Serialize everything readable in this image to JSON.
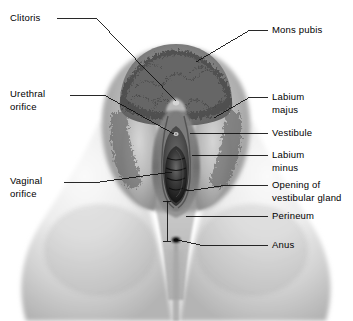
{
  "figure": {
    "type": "labeled-anatomical-illustration",
    "style": "grayscale halftone illustration",
    "background_color": "#ffffff",
    "leader_line_color": "#1a1a1a",
    "text_color": "#000000",
    "width": 353,
    "height": 321
  },
  "labels": {
    "clitoris": "Clitoris",
    "urethral_orifice": "Urethral\norifice",
    "vaginal_orifice": "Vaginal\norifice",
    "mons_pubis": "Mons pubis",
    "labium_majus": "Labium\nmajus",
    "vestibule": "Vestibule",
    "labium_minus": "Labium\nminus",
    "opening_of_vestibular_gland": "Opening of\nvestibular gland",
    "perineum": "Perineum",
    "anus": "Anus"
  },
  "label_positions": {
    "clitoris": {
      "x": 10,
      "y": 12,
      "side": "left"
    },
    "urethral_orifice": {
      "x": 10,
      "y": 88,
      "side": "left"
    },
    "vaginal_orifice": {
      "x": 10,
      "y": 175,
      "side": "left"
    },
    "mons_pubis": {
      "x": 272,
      "y": 24,
      "side": "right"
    },
    "labium_majus": {
      "x": 272,
      "y": 91,
      "side": "right"
    },
    "vestibule": {
      "x": 272,
      "y": 127,
      "side": "right"
    },
    "labium_minus": {
      "x": 272,
      "y": 149,
      "side": "right"
    },
    "opening_of_vestibular_gland": {
      "x": 272,
      "y": 179,
      "side": "right"
    },
    "perineum": {
      "x": 272,
      "y": 210,
      "side": "right"
    },
    "anus": {
      "x": 272,
      "y": 239,
      "side": "right"
    }
  }
}
